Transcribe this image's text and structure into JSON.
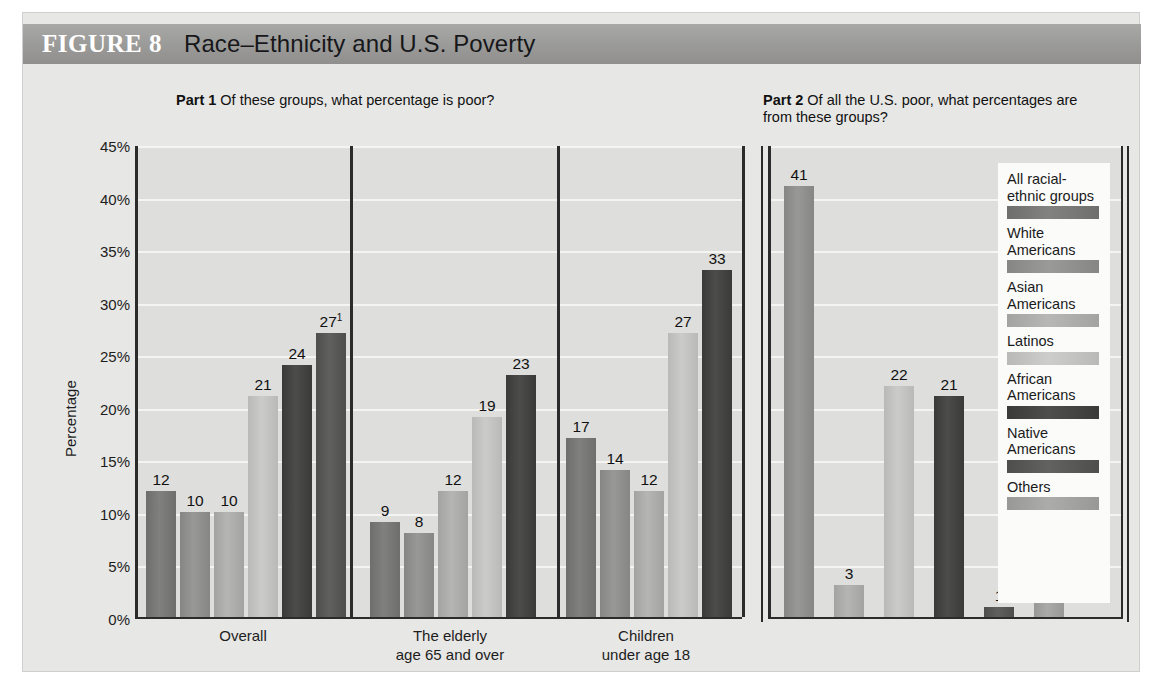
{
  "figure": {
    "number": "FIGURE 8",
    "title": "Race–Ethnicity and U.S. Poverty"
  },
  "part1": {
    "header_bold": "Part 1",
    "header_text": "Of these groups, what percentage is poor?"
  },
  "part2": {
    "header_bold": "Part 2",
    "header_text": "Of all the U.S. poor, what percentages are from these groups?"
  },
  "legend": {
    "items": [
      {
        "label": "All racial-ethnic groups",
        "color": "#6e6e6c"
      },
      {
        "label": "White Americans",
        "color": "#868684"
      },
      {
        "label": "Asian Americans",
        "color": "#a3a3a1"
      },
      {
        "label": "Latinos",
        "color": "#b9b9b7"
      },
      {
        "label": "African Americans",
        "color": "#3a3a38"
      },
      {
        "label": "Native Americans",
        "color": "#4e4e4c"
      },
      {
        "label": "Others",
        "color": "#989896"
      }
    ]
  },
  "chart_data": [
    {
      "type": "bar",
      "title": "Part 1 Of these groups, what percentage is poor?",
      "xlabel": "",
      "ylabel": "Percentage",
      "ylim": [
        0,
        45
      ],
      "yticks": [
        "0%",
        "5%",
        "10%",
        "15%",
        "20%",
        "25%",
        "30%",
        "35%",
        "40%",
        "45%"
      ],
      "grid": true,
      "legend_position": "right",
      "categories": [
        "Overall",
        "The elderly age 65 and over",
        "Children under age 18"
      ],
      "category_lines": [
        [
          "Overall"
        ],
        [
          "The elderly",
          "age 65 and over"
        ],
        [
          "Children",
          "under age 18"
        ]
      ],
      "series": [
        {
          "name": "All racial-ethnic groups",
          "color": "#6e6e6c",
          "values": [
            12,
            9,
            17
          ]
        },
        {
          "name": "White Americans",
          "color": "#868684",
          "values": [
            10,
            8,
            14
          ]
        },
        {
          "name": "Asian Americans",
          "color": "#a3a3a1",
          "values": [
            10,
            12,
            12
          ]
        },
        {
          "name": "Latinos",
          "color": "#b9b9b7",
          "values": [
            21,
            19,
            27
          ]
        },
        {
          "name": "African Americans",
          "color": "#3a3a38",
          "values": [
            24,
            23,
            33
          ]
        },
        {
          "name": "Native Americans",
          "color": "#4e4e4c",
          "values": [
            27,
            null,
            null
          ]
        }
      ],
      "bar_label_notes": {
        "overall_native": "27",
        "overall_native_superscript": "1"
      }
    },
    {
      "type": "bar",
      "title": "Part 2 Of all the U.S. poor, what percentages are from these groups?",
      "xlabel": "",
      "ylabel": "Percentage",
      "ylim": [
        0,
        45
      ],
      "grid": true,
      "categories": [
        "All U.S. poor"
      ],
      "bars": [
        {
          "name": "White Americans",
          "color": "#868684",
          "value": 41,
          "label": "41"
        },
        {
          "name": "Asian Americans",
          "color": "#a3a3a1",
          "value": 3,
          "label": "3"
        },
        {
          "name": "Latinos",
          "color": "#b9b9b7",
          "value": 22,
          "label": "22"
        },
        {
          "name": "African Americans",
          "color": "#3a3a38",
          "value": 21,
          "label": "21"
        },
        {
          "name": "Native Americans",
          "color": "#4e4e4c",
          "value": 1,
          "label": "1"
        },
        {
          "name": "Others",
          "color": "#989896",
          "value": 12,
          "label": "12",
          "superscript": "2"
        }
      ]
    }
  ]
}
